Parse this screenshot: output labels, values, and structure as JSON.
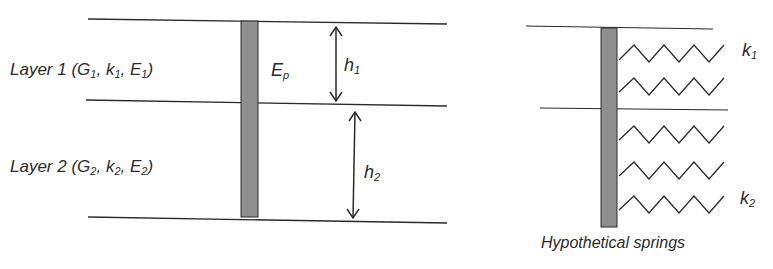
{
  "figure": {
    "left_panel": {
      "layer1": {
        "prefix": "Layer 1 (G",
        "s1": "1",
        "m1": ", k",
        "s2": "1",
        "m2": ", E",
        "s3": "1",
        "suffix": ")"
      },
      "layer2": {
        "prefix": "Layer 2 (G",
        "s1": "2",
        "m1": ", k",
        "s2": "2",
        "m2": ", E",
        "s3": "2",
        "suffix": ")"
      },
      "pile_label": {
        "base": "E",
        "sub": "p"
      },
      "h1": {
        "base": "h",
        "sub": "1"
      },
      "h2": {
        "base": "h",
        "sub": "2"
      }
    },
    "right_panel": {
      "k1": {
        "base": "k",
        "sub": "1"
      },
      "k2": {
        "base": "k",
        "sub": "2"
      },
      "caption": "Hypothetical springs"
    },
    "colors": {
      "line": "#2a2a2a",
      "pile_fill": "#8f8f8f"
    }
  }
}
